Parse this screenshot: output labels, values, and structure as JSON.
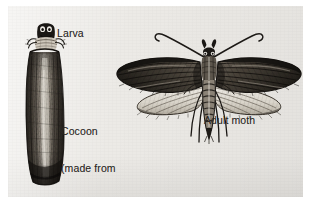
{
  "figure": {
    "background_color": "#eceae6",
    "page_color": "#ffffff",
    "ink_color": "#2a2724",
    "style": "engraved pen-and-ink natural history illustration"
  },
  "labels": {
    "larva": "Larva",
    "cocoon_line1": "Cocoon",
    "cocoon_line2": "(made from",
    "cocoon_line3": "clothing)",
    "adult_moth": "Adult moth"
  },
  "illustrations": {
    "cocoon": {
      "name": "larva-in-cocoon-illustration",
      "description": "dark fibrous upright tube cocoon with larva head emerging at the top"
    },
    "moth": {
      "name": "adult-moth-illustration",
      "description": "adult clothes moth with spread forewings and hindwings, curved antennae, segmented abdomen and legs"
    }
  }
}
